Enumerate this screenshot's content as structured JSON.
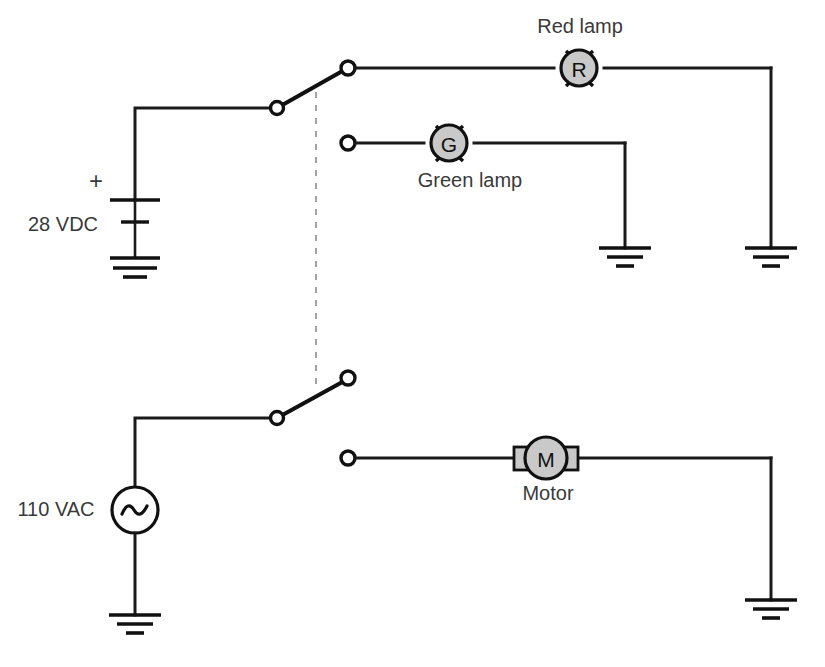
{
  "diagram": {
    "background_color": "#ffffff",
    "line_color": "#1a1a1a",
    "component_fill": "#c9c9c9",
    "dashed_link_color": "#9a9a9a",
    "text_color": "#3a3a3a"
  },
  "sources": {
    "dc": {
      "label": "28 VDC",
      "polarity_marker": "+",
      "type": "battery"
    },
    "ac": {
      "label": "110 VAC",
      "symbol_letter": "~",
      "type": "ac-source"
    }
  },
  "loads": {
    "red_lamp": {
      "label": "Red lamp",
      "symbol_letter": "R",
      "type": "lamp",
      "state": "energized"
    },
    "green_lamp": {
      "label": "Green lamp",
      "symbol_letter": "G",
      "type": "lamp",
      "state": "de-energized"
    },
    "motor": {
      "label": "Motor",
      "symbol_letter": "M",
      "type": "motor",
      "state": "de-energized"
    }
  },
  "switches": {
    "upper": {
      "name": "dc-selector-switch",
      "position": "closed-upper",
      "connected_to": "Red lamp"
    },
    "lower": {
      "name": "ac-selector-switch",
      "position": "open",
      "connected_to": "none"
    },
    "ganged_by": "dashed mechanical link"
  },
  "grounds": {
    "count": 4,
    "names": [
      "battery-ground",
      "green-lamp-ground",
      "red-lamp-ground",
      "ac-source-ground",
      "motor-ground"
    ]
  }
}
